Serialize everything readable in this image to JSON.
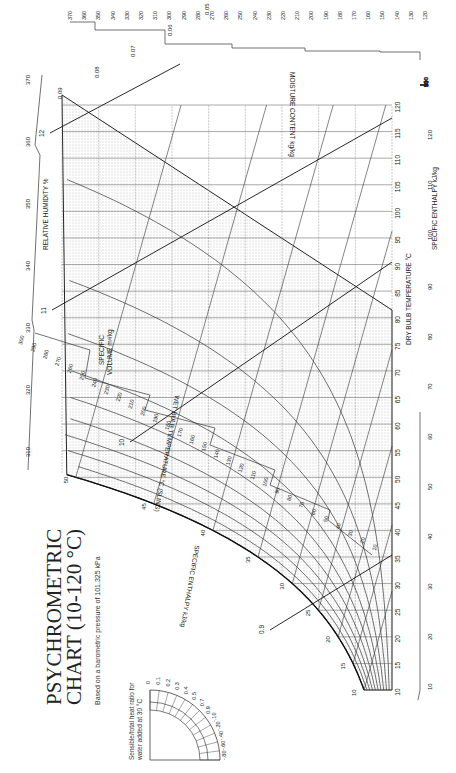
{
  "title_line1": "PSYCHROMETRIC",
  "title_line2": "CHART (10-120 °C)",
  "subtitle": "Based on a barometric pressure of 101.325 kPa",
  "protractor_note_line1": "Sensible/total heat ratio for",
  "protractor_note_line2": "water added at 30 °C",
  "chart_data": {
    "type": "line",
    "orientation": "rotated 90° counter-clockwise",
    "barometric_pressure_kPa": 101.325,
    "xlabel": "DRY BULB TEMPERATURE °C",
    "ylabel": "MOISTURE CONTENT kg/kg",
    "xlim": [
      10,
      120
    ],
    "ylim": [
      0.0,
      0.09
    ],
    "dry_bulb_ticks": [
      10,
      15,
      20,
      25,
      30,
      35,
      40,
      45,
      50,
      55,
      60,
      65,
      70,
      75,
      80,
      85,
      90,
      95,
      100,
      105,
      110,
      115,
      120
    ],
    "moisture_ticks": [
      0.0,
      0.01,
      0.02,
      0.03,
      0.04,
      0.05,
      0.06,
      0.07,
      0.08,
      0.09
    ],
    "relative_humidity_label": "RELATIVE HUMIDITY %",
    "relative_humidity_curves": [
      10,
      20,
      30,
      40,
      50,
      60,
      70,
      80,
      90
    ],
    "wet_bulb_label": "WET BULB TEMPERATURE °C (SLING)",
    "wet_bulb_ticks": [
      10,
      15,
      20,
      25,
      30,
      35,
      40,
      45,
      50
    ],
    "specific_volume_label": "SPECIFIC VOLUME m³/kg",
    "specific_volume_lines": [
      0.9,
      1.0,
      1.1,
      1.2
    ],
    "specific_volume_tick_labels": [
      "0.9",
      "10",
      "11",
      "12"
    ],
    "specific_enthalpy_label": "SPECIFIC ENTHALPY kJ/kg",
    "enthalpy_scale_right": [
      10,
      20,
      30,
      40,
      50,
      60,
      70,
      80,
      90,
      100,
      110,
      120
    ],
    "enthalpy_scale_top": [
      120,
      130,
      140,
      150,
      160,
      170,
      180,
      190,
      200,
      210,
      220,
      230,
      240,
      250,
      260,
      270,
      280,
      290,
      300,
      310,
      320,
      330,
      340,
      350,
      360,
      370
    ],
    "enthalpy_scale_bottom": [
      10,
      20,
      30,
      40,
      50,
      60,
      70,
      80,
      90,
      100,
      110,
      120,
      130,
      140,
      150,
      160,
      170,
      180,
      190,
      200,
      210,
      220,
      230,
      240,
      250,
      260,
      270,
      280,
      290,
      300
    ],
    "enthalpy_scale_left": [
      310,
      320,
      330,
      340,
      350,
      360,
      370
    ],
    "saturation_curve_points": [
      [
        10,
        0.0077
      ],
      [
        20,
        0.0147
      ],
      [
        30,
        0.0273
      ],
      [
        40,
        0.0491
      ],
      [
        45,
        0.0653
      ],
      [
        50,
        0.0868
      ],
      [
        52,
        0.09
      ]
    ],
    "protractor": {
      "label": "Sensible/total heat ratio for water added at 30 °C",
      "values": [
        "0",
        "0.1",
        "0.2",
        "0.3",
        "0.4",
        "0.5",
        "0.7",
        "0.9",
        "-.10",
        "-.20",
        "-.40",
        "-.60",
        "-.80"
      ]
    },
    "grid": true
  }
}
